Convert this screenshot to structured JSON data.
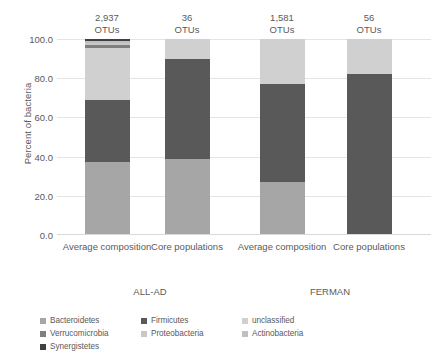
{
  "chart_data": {
    "type": "bar",
    "subtype": "stacked-bar-100pct",
    "title": "",
    "xlabel": "",
    "ylabel": "Percent of bacteria",
    "ylim": [
      0,
      100
    ],
    "yticks": [
      "0.0",
      "20.0",
      "40.0",
      "60.0",
      "80.0",
      "100.0"
    ],
    "ytick_values": [
      0,
      20,
      40,
      60,
      80,
      100
    ],
    "grid": true,
    "legend_position": "bottom",
    "categories": [
      "Average composition",
      "Core populations",
      "Average composition",
      "Core populations"
    ],
    "groups": [
      {
        "label": "ALL-AD",
        "category_indices": [
          0,
          1
        ]
      },
      {
        "label": "FERMAN",
        "category_indices": [
          2,
          3
        ]
      }
    ],
    "bar_annotations": [
      {
        "count": "2,937",
        "unit": "OTUs"
      },
      {
        "count": "36",
        "unit": "OTUs"
      },
      {
        "count": "1,581",
        "unit": "OTUs"
      },
      {
        "count": "56",
        "unit": "OTUs"
      }
    ],
    "series": [
      {
        "name": "Bacteroidetes",
        "color": "#a6a6a6",
        "values": [
          37.0,
          39.0,
          27.0,
          0.0
        ]
      },
      {
        "name": "Firmicutes",
        "color": "#595959",
        "values": [
          32.0,
          51.0,
          50.0,
          82.0
        ]
      },
      {
        "name": "unclassified",
        "color": "#d0d0d0",
        "values": [
          26.5,
          10.0,
          23.0,
          18.0
        ]
      },
      {
        "name": "Verrucomicrobia",
        "color": "#7f7f7f",
        "values": [
          1.5,
          0.0,
          0.0,
          0.0
        ]
      },
      {
        "name": "Proteobacteria",
        "color": "#c8c8c8",
        "values": [
          1.0,
          0.0,
          0.0,
          0.0
        ]
      },
      {
        "name": "Actinobacteria",
        "color": "#bfbfbf",
        "values": [
          1.0,
          0.0,
          0.0,
          0.0
        ]
      },
      {
        "name": "Synergistetes",
        "color": "#404040",
        "values": [
          1.0,
          0.0,
          0.0,
          0.0
        ]
      }
    ]
  },
  "legend": {
    "items": [
      {
        "label": "Bacteroidetes",
        "color": "#a6a6a6"
      },
      {
        "label": "Firmicutes",
        "color": "#595959"
      },
      {
        "label": "unclassified",
        "color": "#d0d0d0"
      },
      {
        "label": "Verrucomicrobia",
        "color": "#7f7f7f"
      },
      {
        "label": "Proteobacteria",
        "color": "#c8c8c8"
      },
      {
        "label": "Actinobacteria",
        "color": "#bfbfbf"
      },
      {
        "label": "Synergistetes",
        "color": "#404040"
      }
    ]
  }
}
